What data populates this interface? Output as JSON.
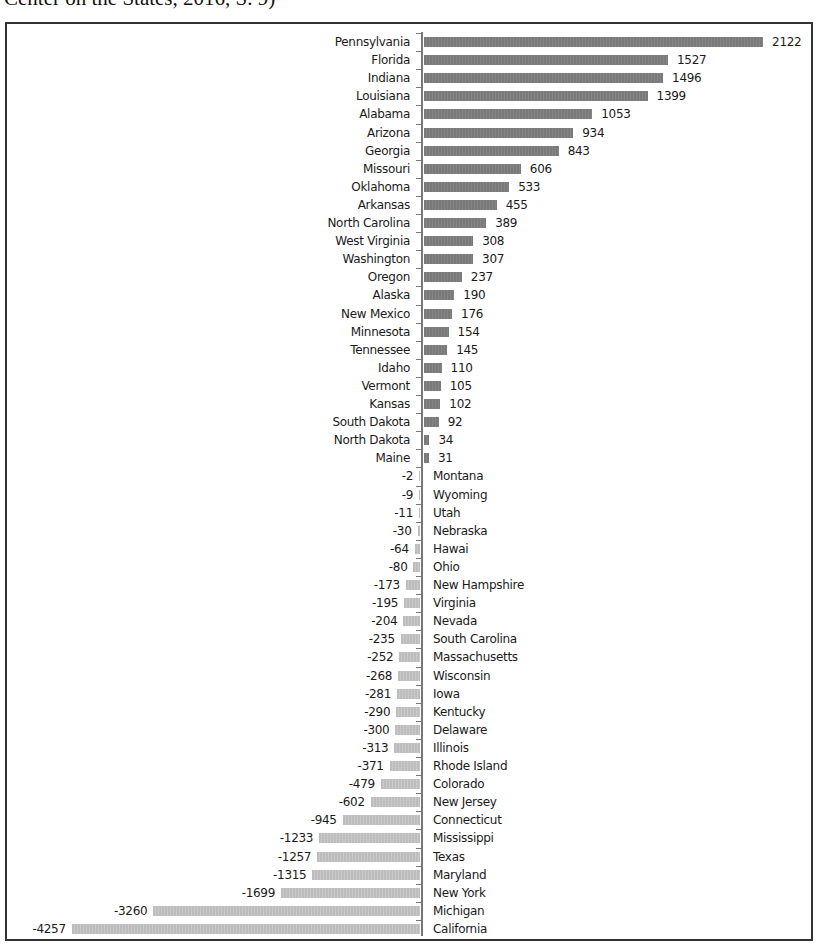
{
  "caption": "Center on the States, 2016, S. 9)",
  "chart_data": {
    "type": "bar",
    "orientation": "horizontal",
    "title": "",
    "xlabel": "",
    "ylabel": "",
    "grid": false,
    "legend": null,
    "colors": {
      "positive": "#7f7f7f",
      "negative": "#c3c3c3",
      "axis": "#777777"
    },
    "categories": [
      "Pennsylvania",
      "Florida",
      "Indiana",
      "Louisiana",
      "Alabama",
      "Arizona",
      "Georgia",
      "Missouri",
      "Oklahoma",
      "Arkansas",
      "North Carolina",
      "West Virginia",
      "Washington",
      "Oregon",
      "Alaska",
      "New Mexico",
      "Minnesota",
      "Tennessee",
      "Idaho",
      "Vermont",
      "Kansas",
      "South Dakota",
      "North Dakota",
      "Maine",
      "Montana",
      "Wyoming",
      "Utah",
      "Nebraska",
      "Hawai",
      "Ohio",
      "New Hampshire",
      "Virginia",
      "Nevada",
      "South Carolina",
      "Massachusetts",
      "Wisconsin",
      "Iowa",
      "Kentucky",
      "Delaware",
      "Illinois",
      "Rhode Island",
      "Colorado",
      "New Jersey",
      "Connecticut",
      "Mississippi",
      "Texas",
      "Maryland",
      "New York",
      "Michigan",
      "California"
    ],
    "values": [
      2122,
      1527,
      1496,
      1399,
      1053,
      934,
      843,
      606,
      533,
      455,
      389,
      308,
      307,
      237,
      190,
      176,
      154,
      145,
      110,
      105,
      102,
      92,
      34,
      31,
      -2,
      -9,
      -11,
      -30,
      -64,
      -80,
      -173,
      -195,
      -204,
      -235,
      -252,
      -268,
      -281,
      -290,
      -300,
      -313,
      -371,
      -479,
      -602,
      -945,
      -1233,
      -1257,
      -1315,
      -1699,
      -3260,
      -4257
    ],
    "layout": {
      "axis_x": 422,
      "top_y": 33,
      "row_h": 18.1,
      "pos_scale": 0.1598,
      "neg_scale": 0.0818
    }
  }
}
